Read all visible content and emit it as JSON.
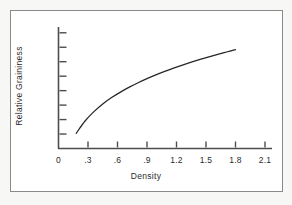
{
  "figure": {
    "background_color": "#f7f7f5",
    "panel_color": "#ffffff",
    "border_color": "#8a8a8a"
  },
  "chart_data": {
    "type": "line",
    "title": "",
    "subtitle": "",
    "xlabel": "Density",
    "ylabel": "Relative Graininess",
    "line_color": "#262626",
    "axis_color": "#4d4d4d",
    "grid": false,
    "legend": false,
    "legend_position": "none",
    "xlim": [
      0,
      2.25
    ],
    "ylim": [
      0,
      8.4
    ],
    "x_ticks": [
      0,
      0.3,
      0.6,
      0.9,
      1.2,
      1.5,
      1.8,
      2.1
    ],
    "x_tick_labels": [
      "0",
      ".3",
      ".6",
      ".9",
      "1.2",
      "1.5",
      "1.8",
      "2.1"
    ],
    "y_ticks": [
      1,
      2,
      3,
      4,
      5,
      6,
      7,
      8
    ],
    "y_tick_labels": [
      "",
      "",
      "",
      "",
      "",
      "",
      "",
      ""
    ],
    "series": [
      {
        "name": "Relative Graininess vs Density",
        "x": [
          0.18,
          0.27,
          0.36,
          0.45,
          0.54,
          0.63,
          0.72,
          0.81,
          0.9,
          0.99,
          1.08,
          1.17,
          1.26,
          1.35,
          1.44,
          1.53,
          1.62,
          1.71,
          1.8
        ],
        "y": [
          1.05,
          1.9,
          2.55,
          3.08,
          3.52,
          3.9,
          4.24,
          4.55,
          4.83,
          5.09,
          5.33,
          5.56,
          5.77,
          5.97,
          6.16,
          6.34,
          6.51,
          6.67,
          6.83
        ]
      }
    ]
  }
}
